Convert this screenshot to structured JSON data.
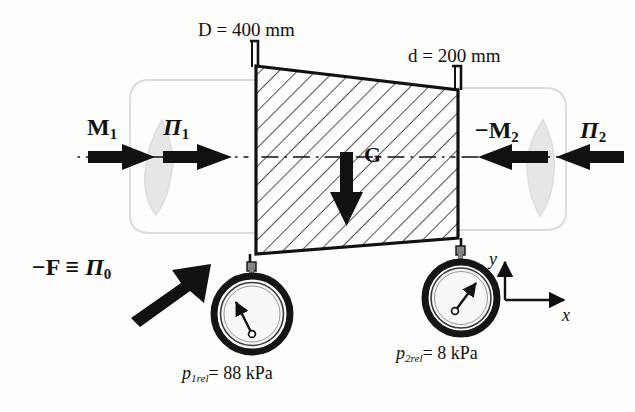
{
  "figure": {
    "background_color": "#fdfdfc",
    "ink_color": "#111111",
    "ghost_color": "#d8d8d8"
  },
  "dimensions": {
    "inlet_label": "D = 400 mm",
    "inlet_symbol": "D",
    "inlet_value": "400",
    "inlet_unit": "mm",
    "outlet_label": "d = 200 mm",
    "outlet_symbol": "d",
    "outlet_value": "200",
    "outlet_unit": "mm"
  },
  "vectors": {
    "m1": {
      "base": "M",
      "sub": "1",
      "sign": "",
      "label": "M1",
      "direction": "right"
    },
    "pi1": {
      "base": "Π",
      "sub": "1",
      "sign": "",
      "label": "Π1",
      "direction": "right"
    },
    "m2": {
      "base": "M",
      "sub": "2",
      "sign": "−",
      "label": "−M2",
      "direction": "left"
    },
    "pi2": {
      "base": "Π",
      "sub": "2",
      "sign": "",
      "label": "Π2",
      "direction": "left"
    },
    "gravity": {
      "base": "G",
      "sub": "",
      "sign": "",
      "label": "G",
      "direction": "down"
    },
    "reaction": {
      "text_f": "−F",
      "equiv": "≡",
      "base": "Π",
      "sub": "0",
      "label": "−F ≡ Π0",
      "direction": "up-right"
    }
  },
  "gauges": [
    {
      "name": "gauge-1",
      "label": "p1rel = 88 kPa",
      "symbol": "p",
      "sub": "1rel",
      "value": "88",
      "unit": "kPa",
      "needle_direction": "up-left"
    },
    {
      "name": "gauge-2",
      "label": "p2rel = 8 kPa",
      "symbol": "p",
      "sub": "2rel",
      "value": "8",
      "unit": "kPa",
      "needle_direction": "down-right"
    }
  ],
  "axes": {
    "x_label": "x",
    "y_label": "y"
  },
  "control_volume": {
    "fill": "hatched",
    "hatch_angle_deg": 45,
    "note": "Trapezoidal control volume between inlet flange D and outlet flange d"
  }
}
